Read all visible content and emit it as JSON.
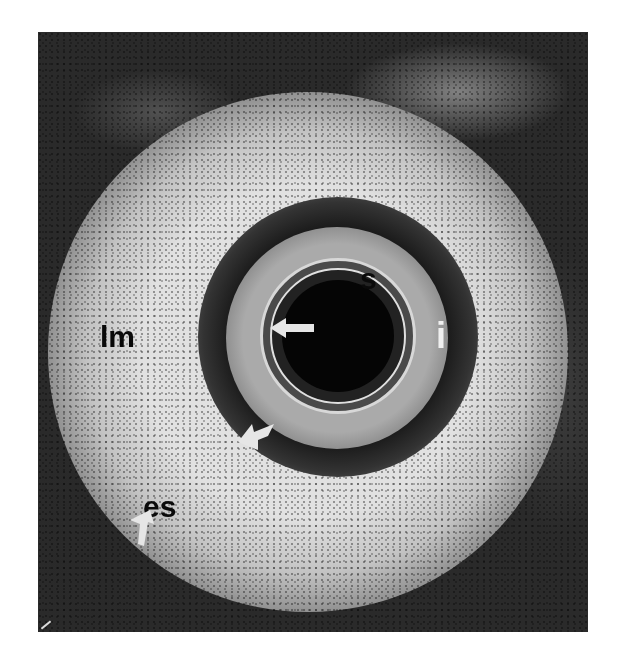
{
  "figure": {
    "type": "endoscopic ultrasound image",
    "labels": {
      "lm": "lm",
      "s": "s",
      "i": "i",
      "es": "es"
    },
    "arrows": [
      {
        "name": "inner-arrow",
        "direction": "left",
        "color": "#e6e6e6"
      },
      {
        "name": "lower-curved-arrow",
        "direction": "down-left",
        "color": "#e6e6e6"
      },
      {
        "name": "es-arrow",
        "direction": "up-left",
        "color": "#e6e6e6"
      }
    ]
  }
}
